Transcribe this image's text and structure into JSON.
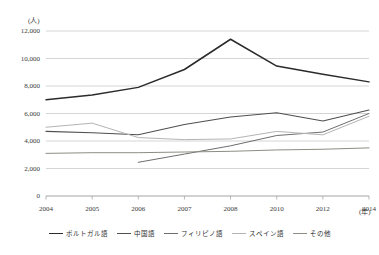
{
  "chart_data": {
    "type": "line",
    "title": "",
    "xlabel": "(年)",
    "ylabel": "(人)",
    "unit_y": "(人)",
    "unit_x": "(年)",
    "x": [
      2004,
      2005,
      2006,
      2007,
      2008,
      2010,
      2012,
      2014
    ],
    "categories": [
      "2004",
      "2005",
      "2006",
      "2007",
      "2008",
      "2010",
      "2012",
      "2014"
    ],
    "ylim": [
      0,
      12000
    ],
    "yticks": [
      0,
      2000,
      4000,
      6000,
      8000,
      10000,
      12000
    ],
    "ytick_labels": [
      "0",
      "2,000",
      "4,000",
      "6,000",
      "8,000",
      "10,000",
      "12,000"
    ],
    "grid": true,
    "legend_position": "bottom",
    "series": [
      {
        "name": "ポルトガル語",
        "color": "#2b2b2b",
        "width": 1.5,
        "values": [
          7000,
          7350,
          7900,
          9200,
          11400,
          9450,
          8850,
          8300
        ]
      },
      {
        "name": "中国語",
        "color": "#4f4f4f",
        "width": 1.1,
        "values": [
          4700,
          4600,
          4450,
          5200,
          5750,
          6050,
          5450,
          6250
        ]
      },
      {
        "name": "フィリピノ語",
        "color": "#6e6e6e",
        "width": 1.0,
        "values": [
          null,
          null,
          2450,
          3050,
          3650,
          4400,
          4650,
          6000
        ]
      },
      {
        "name": "スペイン語",
        "color": "#b4b4b4",
        "width": 1.0,
        "values": [
          5000,
          5300,
          4250,
          4100,
          4150,
          4700,
          4450,
          5800
        ]
      },
      {
        "name": "その他",
        "color": "#8a8f82",
        "width": 1.0,
        "values": [
          3100,
          3150,
          3150,
          3200,
          3250,
          3350,
          3400,
          3500
        ]
      }
    ]
  },
  "legend": {
    "items": [
      {
        "label": "ポルトガル語",
        "color": "#2b2b2b"
      },
      {
        "label": "中国語",
        "color": "#4f4f4f"
      },
      {
        "label": "フィリピノ語",
        "color": "#6e6e6e"
      },
      {
        "label": "スペイン語",
        "color": "#b4b4b4"
      },
      {
        "label": "その他",
        "color": "#8a8f82"
      }
    ]
  },
  "axis": {
    "y_unit": "(人)",
    "x_unit": "(年)"
  }
}
